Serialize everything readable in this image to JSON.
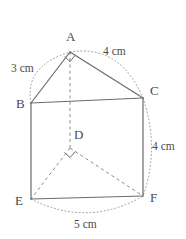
{
  "figure": {
    "stroke_color": "#6b6b6b",
    "hidden_stroke_color": "#8c8c8c",
    "arc_color": "#9a9a9a",
    "label_color": "#4a4a4a",
    "background_color": "#ffffff"
  },
  "vertices": [
    {
      "id": "A",
      "label": "A",
      "x": 70,
      "y": 52,
      "label_x": 66,
      "label_y": 41
    },
    {
      "id": "B",
      "label": "B",
      "x": 31,
      "y": 103,
      "label_x": 16,
      "label_y": 108
    },
    {
      "id": "C",
      "label": "C",
      "x": 143,
      "y": 98,
      "label_x": 150,
      "label_y": 95
    },
    {
      "id": "D",
      "label": "D",
      "x": 70,
      "y": 148,
      "label_x": 74,
      "label_y": 139
    },
    {
      "id": "E",
      "label": "E",
      "x": 31,
      "y": 199,
      "label_x": 15,
      "label_y": 205
    },
    {
      "id": "F",
      "label": "F",
      "x": 143,
      "y": 196,
      "label_x": 150,
      "label_y": 202
    }
  ],
  "edges": [
    {
      "id": "AB",
      "from": "A",
      "to": "B",
      "style": "solid"
    },
    {
      "id": "AC",
      "from": "A",
      "to": "C",
      "style": "solid"
    },
    {
      "id": "BC",
      "from": "B",
      "to": "C",
      "style": "solid"
    },
    {
      "id": "BE",
      "from": "B",
      "to": "E",
      "style": "solid"
    },
    {
      "id": "CF",
      "from": "C",
      "to": "F",
      "style": "solid"
    },
    {
      "id": "EF",
      "from": "E",
      "to": "F",
      "style": "solid"
    },
    {
      "id": "AD",
      "from": "A",
      "to": "D",
      "style": "dashed"
    },
    {
      "id": "DE",
      "from": "D",
      "to": "E",
      "style": "dashed"
    },
    {
      "id": "DF",
      "from": "D",
      "to": "F",
      "style": "dashed"
    }
  ],
  "measurements": [
    {
      "id": "AB",
      "text": "3 cm",
      "x": 11,
      "y": 72,
      "arc": "B-to-A"
    },
    {
      "id": "AC",
      "text": "4 cm",
      "x": 103,
      "y": 55,
      "arc": "A-to-C"
    },
    {
      "id": "CF",
      "text": "4 cm",
      "x": 152,
      "y": 150,
      "arc": "C-to-F"
    },
    {
      "id": "EF",
      "text": "5 cm",
      "x": 74,
      "y": 228,
      "arc": "E-to-F"
    }
  ],
  "right_angles": [
    {
      "id": "angle-at-A",
      "vertex": "A",
      "x": 70,
      "y": 52
    },
    {
      "id": "angle-at-D",
      "vertex": "D",
      "x": 70,
      "y": 148
    }
  ]
}
